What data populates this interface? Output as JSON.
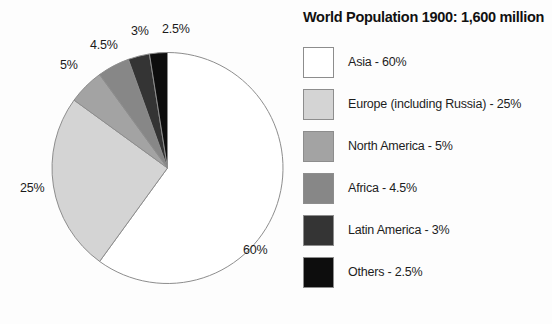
{
  "header": {
    "title": "World Population 1900: 1,600 million"
  },
  "chart_data": {
    "type": "pie",
    "title": "World Population 1900: 1,600 million",
    "total_label": "1,600 million",
    "year": "1900",
    "unit": "percent",
    "start_angle_deg": 0,
    "direction": "clockwise",
    "legend_position": "right",
    "grid": false,
    "categories": [
      "Asia",
      "Europe (including Russia)",
      "North America",
      "Africa",
      "Latin America",
      "Others"
    ],
    "values": [
      60,
      25,
      5,
      4.5,
      3,
      2.5
    ],
    "value_labels": [
      "60%",
      "25%",
      "5%",
      "4.5%",
      "3%",
      "2.5%"
    ],
    "colors": [
      "#ffffff",
      "#d4d4d4",
      "#a3a3a3",
      "#878787",
      "#343434",
      "#0d0d0d"
    ],
    "stroke_color": "#8d8d8d",
    "slices": [
      {
        "name": "Asia",
        "value": 60,
        "label": "60%",
        "color": "#ffffff",
        "legend_label": "Asia - 60%",
        "label_x": 243,
        "label_y": 243
      },
      {
        "name": "Europe (including Russia)",
        "value": 25,
        "label": "25%",
        "color": "#d4d4d4",
        "legend_label": "Europe (including Russia) - 25%",
        "label_x": 20,
        "label_y": 181
      },
      {
        "name": "North America",
        "value": 5,
        "label": "5%",
        "color": "#a3a3a3",
        "legend_label": "North America - 5%",
        "label_x": 60,
        "label_y": 58
      },
      {
        "name": "Africa",
        "value": 4.5,
        "label": "4.5%",
        "color": "#878787",
        "legend_label": "Africa - 4.5%",
        "label_x": 90,
        "label_y": 38
      },
      {
        "name": "Latin America",
        "value": 3,
        "label": "3%",
        "color": "#343434",
        "legend_label": "Latin America - 3%",
        "label_x": 131,
        "label_y": 24
      },
      {
        "name": "Others",
        "value": 2.5,
        "label": "2.5%",
        "color": "#0d0d0d",
        "legend_label": "Others - 2.5%",
        "label_x": 162,
        "label_y": 22
      }
    ]
  },
  "legend": {
    "items": [
      {
        "label": "Asia - 60%",
        "color": "#ffffff"
      },
      {
        "label": "Europe (including Russia) - 25%",
        "color": "#d4d4d4"
      },
      {
        "label": "North America - 5%",
        "color": "#a3a3a3"
      },
      {
        "label": "Africa - 4.5%",
        "color": "#878787"
      },
      {
        "label": "Latin America - 3%",
        "color": "#343434"
      },
      {
        "label": "Others - 2.5%",
        "color": "#0d0d0d"
      }
    ]
  }
}
